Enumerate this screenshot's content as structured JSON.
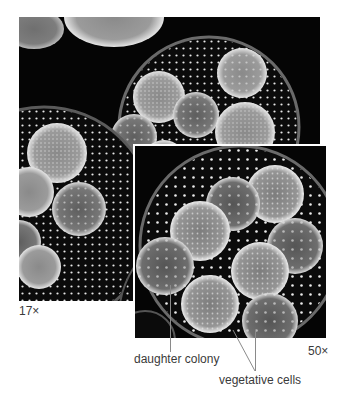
{
  "figure": {
    "main_photo": {
      "magnification_label": "17×"
    },
    "inset_photo": {
      "magnification_label": "50×"
    },
    "callouts": [
      {
        "id": "daughter-colony",
        "label": "daughter colony"
      },
      {
        "id": "vegetative-cells",
        "label": "vegetative cells"
      }
    ]
  },
  "colors": {
    "background": "#ffffff",
    "photo_background": "#050505",
    "cell_glow": "#d9d9d9",
    "label_text": "#3a3a3a",
    "leader_line": "#777777"
  }
}
